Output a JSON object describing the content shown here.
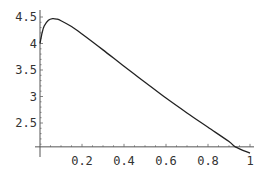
{
  "chart_data": {
    "type": "line",
    "title": "",
    "xlabel": "",
    "ylabel": "",
    "xlim": [
      0,
      1
    ],
    "ylim": [
      2.05,
      4.55
    ],
    "x_axis_crossing_y": 2.05,
    "grid": false,
    "legend": null,
    "x_ticks": [
      0.2,
      0.4,
      0.6,
      0.8,
      1
    ],
    "x_tick_labels": [
      "0.2",
      "0.4",
      "0.6",
      "0.8",
      "1"
    ],
    "y_ticks": [
      2.5,
      3,
      3.5,
      4,
      4.5
    ],
    "y_tick_labels": [
      "2.5",
      "3",
      "3.5",
      "4",
      "4.5"
    ],
    "series": [
      {
        "name": "curve",
        "color": "#222222",
        "x": [
          0,
          0.01,
          0.02,
          0.04,
          0.06,
          0.08,
          0.1,
          0.15,
          0.2,
          0.3,
          0.4,
          0.5,
          0.6,
          0.7,
          0.8,
          0.9,
          0.93,
          1.0
        ],
        "y": [
          4.0,
          4.2,
          4.33,
          4.44,
          4.47,
          4.46,
          4.43,
          4.32,
          4.18,
          3.88,
          3.57,
          3.27,
          2.97,
          2.69,
          2.42,
          2.15,
          2.05,
          1.93
        ]
      }
    ]
  }
}
